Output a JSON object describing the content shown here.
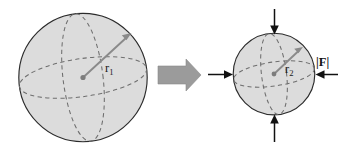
{
  "figure": {
    "background_color": "#ffffff",
    "width": 343,
    "height": 152
  },
  "colors": {
    "sphere_fill": "#dcdcdc",
    "sphere_outline": "#2b2b2b",
    "dashed_guide": "#6e6e6e",
    "radius_arrow": "#8a8a8a",
    "force_arrow": "#111111",
    "block_arrow": "#9b9b9b",
    "label_text": "#1a1a1a"
  },
  "left_sphere": {
    "name": "undeformed-sphere",
    "center_x": 83,
    "center_y": 77.5,
    "radius": 64.5,
    "radius_label": "r",
    "radius_subscript": "1",
    "radius_label_full": "r1",
    "has_meridian": true,
    "has_equator": true
  },
  "transition": {
    "name": "transition-arrow",
    "direction": "right",
    "label": ""
  },
  "right_sphere": {
    "name": "compressed-sphere",
    "center_x": 274,
    "center_y": 74,
    "radius": 41,
    "radius_label": "r",
    "radius_subscript": "2",
    "radius_label_full": "r2",
    "has_meridian": true,
    "has_equator": true
  },
  "force_arrows": [
    {
      "name": "force-arrow-top",
      "direction": "down",
      "label": ""
    },
    {
      "name": "force-arrow-bottom",
      "direction": "up",
      "label": ""
    },
    {
      "name": "force-arrow-left",
      "direction": "right",
      "label": ""
    },
    {
      "name": "force-arrow-right",
      "direction": "left",
      "label": "|F|"
    }
  ],
  "force_magnitude_label": "|F|"
}
